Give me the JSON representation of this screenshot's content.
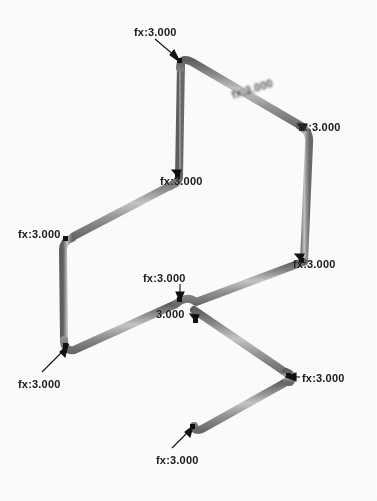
{
  "view": {
    "background": "#ffffff",
    "beam_color": "#8a8a8a",
    "beam_highlight": "#c9c9c9",
    "beam_shadow": "#6a6a6a",
    "annotation_color": "#1a1a1a",
    "width": 377,
    "height": 501
  },
  "annotations": {
    "load_prefix": "fx:",
    "load_value": "3.000",
    "nodes": [
      {
        "id": "node-top-apex",
        "label": "fx:3.000",
        "label_x": 134,
        "label_y": 27,
        "node_x": 181,
        "node_y": 62,
        "leader": "down-right",
        "state": "clear"
      },
      {
        "id": "node-top-beam-mid",
        "label": "fx:3.000",
        "label_x": 232,
        "label_y": 90,
        "node_x": 262,
        "node_y": 104,
        "leader": "none",
        "state": "blurred"
      },
      {
        "id": "node-top-right",
        "label": "fx:3.000",
        "label_x": 298,
        "label_y": 122,
        "node_x": 305,
        "node_y": 131,
        "leader": "none",
        "state": "occluded"
      },
      {
        "id": "node-mid-left-upper",
        "label": "fx:3.000",
        "label_x": 160,
        "label_y": 176,
        "node_x": 178,
        "node_y": 178,
        "leader": "none",
        "state": "occluded"
      },
      {
        "id": "node-left-upper",
        "label": "fx:3.000",
        "label_x": 18,
        "label_y": 229,
        "node_x": 65,
        "node_y": 239,
        "leader": "none",
        "state": "clear"
      },
      {
        "id": "node-right-mid",
        "label": "fx:3.000",
        "label_x": 293,
        "label_y": 259,
        "node_x": 300,
        "node_y": 262,
        "leader": "none",
        "state": "occluded"
      },
      {
        "id": "node-center-upper",
        "label": "fx:3.000",
        "label_x": 143,
        "label_y": 273,
        "node_x": 180,
        "node_y": 300,
        "leader": "down",
        "state": "clear"
      },
      {
        "id": "node-center-cross",
        "label": "3.000",
        "label_x": 156,
        "label_y": 309,
        "node_x": 196,
        "node_y": 322,
        "leader": "none",
        "state": "occluded"
      },
      {
        "id": "node-left-lower",
        "label": "fx:3.000",
        "label_x": 18,
        "label_y": 379,
        "node_x": 68,
        "node_y": 348,
        "leader": "up-right",
        "state": "clear"
      },
      {
        "id": "node-triangle-right",
        "label": "fx:3.000",
        "label_x": 302,
        "label_y": 373,
        "node_x": 289,
        "node_y": 377,
        "leader": "left",
        "state": "clear"
      },
      {
        "id": "node-triangle-bottom",
        "label": "fx:3.000",
        "label_x": 156,
        "label_y": 455,
        "node_x": 193,
        "node_y": 428,
        "leader": "up-right",
        "state": "clear"
      }
    ]
  },
  "geometry": {
    "description": "3D beam frame wireframe with one triangular sub-frame",
    "members": [
      {
        "id": "m-top-left-column",
        "x1": 180,
        "y1": 66,
        "x2": 179,
        "y2": 175
      },
      {
        "id": "m-top-diagonal",
        "x1": 186,
        "y1": 61,
        "x2": 303,
        "y2": 128
      },
      {
        "id": "m-right-column",
        "x1": 308,
        "y1": 135,
        "x2": 303,
        "y2": 263
      },
      {
        "id": "m-upper-left-diag",
        "x1": 175,
        "y1": 180,
        "x2": 68,
        "y2": 236
      },
      {
        "id": "m-left-column",
        "x1": 64,
        "y1": 242,
        "x2": 66,
        "y2": 344
      },
      {
        "id": "m-lower-left-diag",
        "x1": 71,
        "y1": 349,
        "x2": 178,
        "y2": 303
      },
      {
        "id": "m-center-to-right",
        "x1": 185,
        "y1": 301,
        "x2": 300,
        "y2": 262
      },
      {
        "id": "m-tri-left",
        "x1": 192,
        "y1": 312,
        "x2": 192,
        "y2": 425
      },
      {
        "id": "m-tri-hyp-upper",
        "x1": 196,
        "y1": 314,
        "x2": 289,
        "y2": 374
      },
      {
        "id": "m-tri-hyp-lower",
        "x1": 197,
        "y1": 428,
        "x2": 288,
        "y2": 380
      }
    ]
  }
}
